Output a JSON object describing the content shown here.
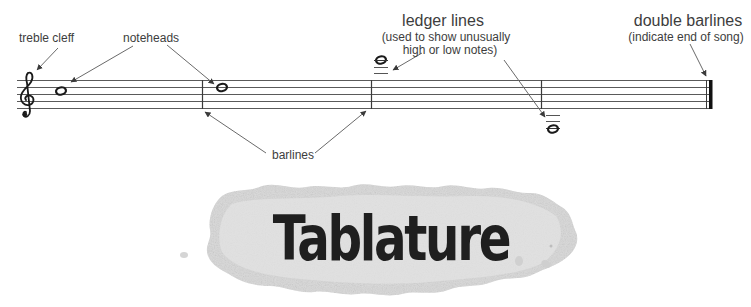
{
  "diagram": {
    "type": "music-notation-annotated-staff",
    "colors": {
      "background": "#ffffff",
      "staff_line": "#555555",
      "label_text": "#3d3d3d",
      "arrow": "#6a6a6a",
      "note": "#1a1a1a",
      "blob": "#dcdcdc",
      "title_text": "#1f1f1f"
    },
    "staff": {
      "line_count": 5,
      "barline_count": 3,
      "has_double_barline": true
    },
    "labels": {
      "treble_clef": "treble cleff",
      "noteheads": "noteheads",
      "ledger_title": "ledger lines",
      "ledger_sub_1": "(used to show  unusually",
      "ledger_sub_2": "high or low notes)",
      "double_barlines_title": "double barlines",
      "double_barlines_sub": "(indicate end of song)",
      "barlines": "barlines"
    },
    "symbols": {
      "clef": "treble-clef",
      "clef_glyph": "𝄞",
      "note_glyph": "whole-note"
    },
    "banner": {
      "title": "Tablature"
    }
  }
}
